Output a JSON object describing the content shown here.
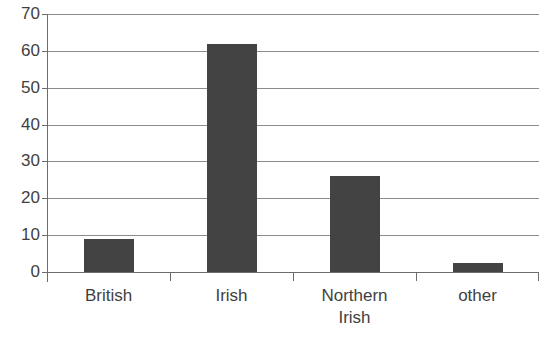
{
  "title_remnant": "",
  "colors": {
    "bar_fill": "#434343",
    "gridline": "#8c8c8c",
    "axis": "#6d6d6d",
    "background": "#ffffff",
    "text": "#3f3f3f"
  },
  "chart_data": {
    "type": "bar",
    "title": "",
    "xlabel": "",
    "ylabel": "",
    "categories": [
      "British",
      "Irish",
      "Northern Irish",
      "other"
    ],
    "category_lines": [
      [
        "British"
      ],
      [
        "Irish"
      ],
      [
        "Northern",
        "Irish"
      ],
      [
        "other"
      ]
    ],
    "values": [
      9,
      62,
      26,
      2.5
    ],
    "ylim": [
      0,
      70
    ],
    "ytick_step": 10,
    "yticks": [
      0,
      10,
      20,
      30,
      40,
      50,
      60,
      70
    ],
    "ytick_labels": [
      "0",
      "10",
      "20",
      "30",
      "40",
      "50",
      "60",
      "70"
    ],
    "grid": true,
    "legend": false,
    "legend_position": "none"
  }
}
